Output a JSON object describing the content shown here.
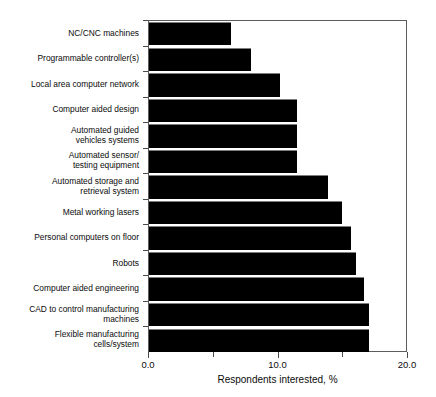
{
  "chart_data": {
    "type": "bar",
    "orientation": "horizontal",
    "title": "",
    "xlabel": "Respondents interested, %",
    "ylabel": "",
    "xlim": [
      0.0,
      20.0
    ],
    "xticks": [
      "0.0",
      "10.0",
      "20.0"
    ],
    "xtick_values": [
      0.0,
      10.0,
      20.0
    ],
    "minor_xtick_values": [
      5.0,
      15.0
    ],
    "grid": false,
    "legend": null,
    "bar_color": "#000000",
    "categories": [
      "NC/CNC machines",
      "Programmable controller(s)",
      "Local area computer network",
      "Computer aided design",
      "Automated guided\nvehicles systems",
      "Automated sensor/\ntesting equipment",
      "Automated  storage and\nretrieval system",
      "Metal working lasers",
      "Personal computers on floor",
      "Robots",
      "Computer aided engineering",
      "CAD to control manufacturing\nmachines",
      "Flexible manufacturing\ncells/system"
    ],
    "values": [
      6.4,
      7.9,
      10.2,
      11.5,
      11.5,
      11.5,
      13.9,
      15.0,
      15.7,
      16.1,
      16.7,
      17.1,
      17.1
    ]
  }
}
